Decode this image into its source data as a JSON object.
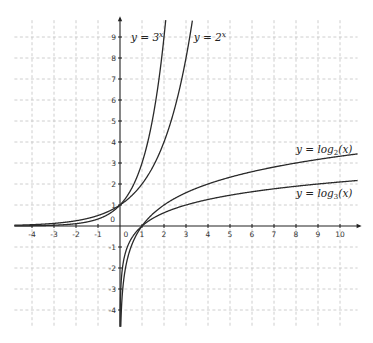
{
  "chart_data": {
    "type": "line",
    "title": "",
    "xlabel": "",
    "ylabel": "",
    "xlim": [
      -4.8,
      10.8
    ],
    "ylim": [
      -4.8,
      9.8
    ],
    "grid": true,
    "grid_style": "dashed",
    "x_ticks": [
      -4,
      -3,
      -2,
      -1,
      0,
      1,
      2,
      3,
      4,
      5,
      6,
      7,
      8,
      9,
      10
    ],
    "y_ticks": [
      -4,
      -3,
      -2,
      -1,
      0,
      1,
      2,
      3,
      4,
      5,
      6,
      7,
      8,
      9
    ],
    "x_tick_labels": [
      "-4",
      "-3",
      "-2",
      "-1",
      "0",
      "1",
      "2",
      "3",
      "4",
      "5",
      "6",
      "7",
      "8",
      "9",
      "10"
    ],
    "y_tick_labels": [
      "-4",
      "-3",
      "-2",
      "-1",
      "0",
      "1",
      "2",
      "3",
      "4",
      "5",
      "6",
      "7",
      "8",
      "9"
    ],
    "series": [
      {
        "name": "y = 3^x",
        "label_main": "y = 3",
        "label_sup": "x",
        "function": "3^x",
        "label_pos": [
          0.5,
          9.0
        ],
        "x": [
          -4.8,
          -4,
          -3,
          -2,
          -1,
          0,
          0.5,
          1,
          1.5,
          2,
          2.08
        ],
        "values": [
          0.005,
          0.012,
          0.037,
          0.111,
          0.333,
          1,
          1.732,
          3,
          5.196,
          9,
          9.8
        ]
      },
      {
        "name": "y = 2^x",
        "label_main": "y = 2",
        "label_sup": "x",
        "function": "2^x",
        "label_pos": [
          3.35,
          9.0
        ],
        "x": [
          -4.8,
          -4,
          -3,
          -2,
          -1,
          0,
          1,
          2,
          2.5,
          3,
          3.29
        ],
        "values": [
          0.036,
          0.0625,
          0.125,
          0.25,
          0.5,
          1,
          2,
          4,
          5.657,
          8,
          9.8
        ]
      },
      {
        "name": "y = log2(x)",
        "label_main": "y = log",
        "label_sub": "2",
        "label_tail": "(x)",
        "function": "log2(x)",
        "label_pos": [
          8.0,
          3.65
        ],
        "x": [
          0.036,
          0.0625,
          0.125,
          0.25,
          0.5,
          1,
          2,
          4,
          8,
          10.8
        ],
        "values": [
          -4.8,
          -4,
          -3,
          -2,
          -1,
          0,
          1,
          2,
          3,
          3.43
        ]
      },
      {
        "name": "y = log3(x)",
        "label_main": "y = log",
        "label_sub": "3",
        "label_tail": "(x)",
        "function": "log3(x)",
        "label_pos": [
          8.0,
          1.55
        ],
        "x": [
          0.005,
          0.012,
          0.037,
          0.111,
          0.333,
          1,
          3,
          9,
          10.8
        ],
        "values": [
          -4.8,
          -4,
          -3,
          -2,
          -1,
          0,
          1,
          2,
          2.17
        ]
      }
    ]
  }
}
